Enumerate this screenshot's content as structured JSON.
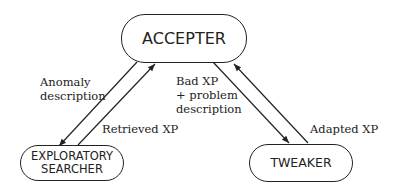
{
  "nodes": {
    "accepter": {
      "label": "ACCEPTER"
    },
    "exploratory_searcher": {
      "line1": "EXPLORATORY",
      "line2": "SEARCHER"
    },
    "tweaker": {
      "label": "TWEAKER"
    }
  },
  "edges": {
    "anomaly_description": {
      "line1": "Anomaly",
      "line2": "description"
    },
    "retrieved_xp": {
      "label": "Retrieved XP"
    },
    "bad_xp": {
      "line1": "Bad XP",
      "line2": "+ problem",
      "line3": "description"
    },
    "adapted_xp": {
      "label": "Adapted XP"
    }
  },
  "colors": {
    "stroke": "#222222",
    "background": "#ffffff"
  }
}
